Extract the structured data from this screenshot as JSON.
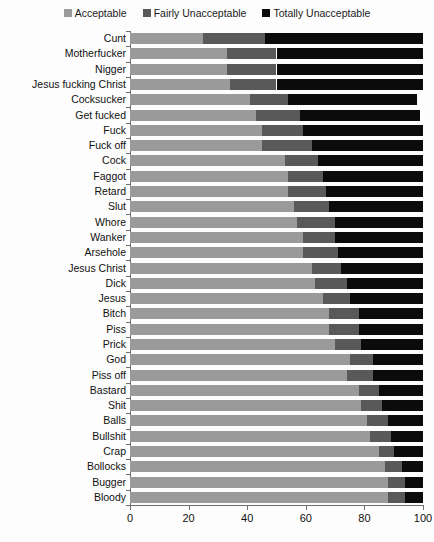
{
  "chart_data": {
    "type": "bar",
    "orientation": "horizontal",
    "stacked": true,
    "stack_mode": "percent",
    "title": "",
    "subtitle": "",
    "xlabel": "",
    "ylabel": "",
    "xlim": [
      0,
      100
    ],
    "xticks": [
      0,
      20,
      40,
      60,
      80,
      100
    ],
    "xticklabels": [
      "0",
      "20",
      "40",
      "60",
      "80",
      "100"
    ],
    "grid": false,
    "legend_position": "top-center",
    "legend": [
      "Acceptable",
      "Fairly Unacceptable",
      "Totally Unacceptable"
    ],
    "colors": {
      "Acceptable": "#9a9a9a",
      "Fairly Unacceptable": "#595959",
      "Totally Unacceptable": "#0b0b0b"
    },
    "categories": [
      "Cunt",
      "Motherfucker",
      "Nigger",
      "Jesus fucking Christ",
      "Cocksucker",
      "Get fucked",
      "Fuck",
      "Fuck off",
      "Cock",
      "Faggot",
      "Retard",
      "Slut",
      "Whore",
      "Wanker",
      "Arsehole",
      "Jesus Christ",
      "Dick",
      "Jesus",
      "Bitch",
      "Piss",
      "Prick",
      "God",
      "Piss off",
      "Bastard",
      "Shit",
      "Balls",
      "Bullshit",
      "Crap",
      "Bollocks",
      "Bugger",
      "Bloody"
    ],
    "series": [
      {
        "name": "Acceptable",
        "color": "#9a9a9a",
        "values": [
          25,
          33,
          33,
          34,
          41,
          43,
          45,
          45,
          53,
          54,
          54,
          56,
          57,
          59,
          59,
          62,
          63,
          66,
          68,
          68,
          70,
          75,
          74,
          78,
          79,
          81,
          82,
          85,
          87,
          88,
          88
        ]
      },
      {
        "name": "Fairly Unacceptable",
        "color": "#595959",
        "values": [
          21,
          17,
          17,
          16,
          13,
          15,
          14,
          17,
          11,
          12,
          13,
          12,
          13,
          11,
          12,
          10,
          11,
          9,
          10,
          10,
          9,
          8,
          9,
          7,
          7,
          7,
          7,
          5,
          6,
          6,
          6
        ]
      },
      {
        "name": "Totally Unacceptable",
        "color": "#0b0b0b",
        "values": [
          54,
          50,
          50,
          50,
          44,
          41,
          41,
          38,
          36,
          34,
          33,
          32,
          30,
          30,
          29,
          28,
          26,
          25,
          22,
          22,
          21,
          17,
          17,
          15,
          14,
          12,
          11,
          10,
          7,
          6,
          6
        ]
      }
    ],
    "row_totals": [
      100,
      100,
      100,
      100,
      98,
      99,
      100,
      100,
      100,
      100,
      100,
      100,
      100,
      100,
      100,
      100,
      100,
      100,
      100,
      100,
      100,
      100,
      100,
      100,
      100,
      100,
      100,
      100,
      100,
      100,
      100
    ]
  },
  "legend": {
    "items": [
      {
        "label": "Acceptable",
        "color": "#9a9a9a"
      },
      {
        "label": "Fairly Unacceptable",
        "color": "#595959"
      },
      {
        "label": "Totally Unacceptable",
        "color": "#0b0b0b"
      }
    ]
  },
  "axis": {
    "x_labels": [
      "0",
      "20",
      "40",
      "60",
      "80",
      "100"
    ]
  }
}
